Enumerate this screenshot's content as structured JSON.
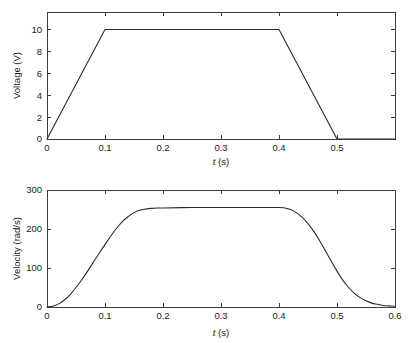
{
  "figure": {
    "background": "#ffffff",
    "line_color": "#2b2b2b",
    "axis_color": "#3c3c3c"
  },
  "chart_data": [
    {
      "type": "line",
      "id": "voltage-vs-time",
      "title": "",
      "xlabel": "t (s)",
      "xlabel_italic_part": "t",
      "xlabel_rest": " (s)",
      "ylabel": "Voltage (V)",
      "xlim": [
        0,
        0.6
      ],
      "ylim": [
        0,
        11.6
      ],
      "xticks": [
        0,
        0.1,
        0.2,
        0.3,
        0.4,
        0.5
      ],
      "xticklabels": [
        "0",
        "0.1",
        "0.2",
        "0.3",
        "0.4",
        "0.5"
      ],
      "yticks": [
        0,
        2,
        4,
        6,
        8,
        10
      ],
      "yticklabels": [
        "0",
        "2",
        "4",
        "6",
        "8",
        "10"
      ],
      "grid": false,
      "legend": null,
      "series": [
        {
          "name": "Voltage",
          "x": [
            0,
            0.1,
            0.4,
            0.5,
            0.6
          ],
          "y": [
            0,
            10,
            10,
            0,
            0
          ]
        }
      ],
      "annotations": [
        "Trapezoidal voltage command: linear ramp up 0 to 10 V over 0-0.1 s, hold 10 V until 0.4 s, linear ramp down to 0 V at 0.5 s."
      ]
    },
    {
      "type": "line",
      "id": "velocity-vs-time",
      "title": "",
      "xlabel": "t (s)",
      "xlabel_italic_part": "t",
      "xlabel_rest": " (s)",
      "ylabel": "Velocity (rad/s)",
      "xlim": [
        0,
        0.6
      ],
      "ylim": [
        0,
        300
      ],
      "xticks": [
        0,
        0.1,
        0.2,
        0.3,
        0.4,
        0.5,
        0.6
      ],
      "xticklabels": [
        "0",
        "0.1",
        "0.2",
        "0.3",
        "0.4",
        "0.5",
        "0.6"
      ],
      "yticks": [
        0,
        100,
        200,
        300
      ],
      "yticklabels": [
        "0",
        "100",
        "200",
        "300"
      ],
      "grid": false,
      "legend": null,
      "series": [
        {
          "name": "Velocity",
          "x": [
            0,
            0.01,
            0.02,
            0.03,
            0.04,
            0.05,
            0.06,
            0.07,
            0.08,
            0.09,
            0.1,
            0.11,
            0.12,
            0.13,
            0.14,
            0.15,
            0.16,
            0.17,
            0.18,
            0.19,
            0.2,
            0.25,
            0.3,
            0.35,
            0.4,
            0.41,
            0.42,
            0.43,
            0.44,
            0.45,
            0.46,
            0.47,
            0.48,
            0.49,
            0.5,
            0.51,
            0.52,
            0.53,
            0.54,
            0.55,
            0.56,
            0.57,
            0.58,
            0.59,
            0.6
          ],
          "y": [
            0,
            2,
            8,
            18,
            32,
            50,
            70,
            92,
            115,
            138,
            160,
            182,
            202,
            219,
            232,
            242,
            248,
            251,
            253,
            254,
            254,
            255,
            255,
            255,
            255,
            254,
            250,
            242,
            230,
            214,
            194,
            170,
            144,
            118,
            92,
            69,
            50,
            35,
            24,
            16,
            10,
            7,
            4,
            3,
            2
          ]
        }
      ],
      "annotations": [
        "Motor speed response: smooth S-curve rise to about 255 rad/s plateau between 0.17 and 0.41 s, then smooth decay toward 0 rad/s after 0.5 s."
      ]
    }
  ]
}
